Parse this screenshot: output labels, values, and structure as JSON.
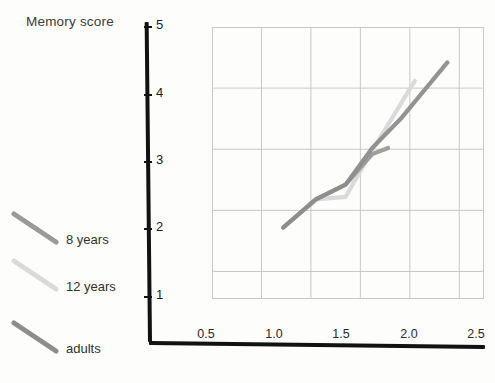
{
  "chart_data": {
    "type": "line",
    "title": "Memory score",
    "xlabel": "",
    "ylabel": "Memory score",
    "xlim": [
      0.0,
      2.75
    ],
    "ylim": [
      0.55,
      5.0
    ],
    "grid": true,
    "legend_position": "left-outside",
    "x_ticks": [
      "0.5",
      "1.0",
      "1.5",
      "2.0",
      "2.5"
    ],
    "x_tick_values": [
      0.5,
      1.0,
      1.5,
      2.0,
      2.5
    ],
    "y_ticks": [
      "1",
      "2",
      "3",
      "4",
      "5"
    ],
    "y_tick_values": [
      1,
      2,
      3,
      4,
      5
    ],
    "series": [
      {
        "name": "8 years",
        "color": "#9a9a9a",
        "x": [
          0.72,
          1.05,
          1.35,
          1.62,
          1.78
        ],
        "y": [
          1.72,
          2.18,
          2.42,
          2.92,
          3.02
        ]
      },
      {
        "name": "12 years",
        "color": "#d8d8d8",
        "x": [
          0.72,
          1.05,
          1.35,
          1.62,
          2.05
        ],
        "y": [
          1.72,
          2.18,
          2.22,
          2.98,
          4.12
        ]
      },
      {
        "name": "adults",
        "color": "#8d8d8d",
        "x": [
          0.72,
          1.05,
          1.35,
          1.62,
          1.92,
          2.38
        ],
        "y": [
          1.72,
          2.18,
          2.42,
          3.02,
          3.52,
          4.42
        ]
      }
    ]
  },
  "legend": {
    "items": [
      {
        "label": "8 years",
        "color": "#9a9a9a"
      },
      {
        "label": "12 years",
        "color": "#dadada"
      },
      {
        "label": "adults",
        "color": "#8d8d8d"
      }
    ]
  },
  "colors": {
    "axis": "#121212",
    "grid": "#c8c8c8",
    "background": "#fdfdfc",
    "text": "#2a2a2a"
  }
}
